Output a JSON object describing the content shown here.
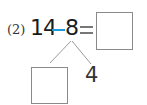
{
  "problem": {
    "label": "(2)",
    "minuend": "14",
    "operator": "−",
    "subtrahend": "8",
    "equals": "=",
    "answer_box_value": "",
    "decomposition": {
      "left_box_value": "",
      "right_value": "4"
    }
  },
  "colors": {
    "minus_sign": "#1c9bd6",
    "text": "#1a1a1a",
    "box_border": "#8a8a8a"
  }
}
